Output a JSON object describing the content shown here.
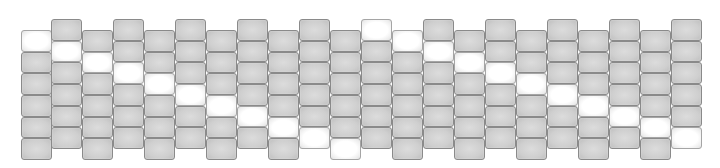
{
  "grid": {
    "columns": 22,
    "rows_per_column": 6,
    "column_x": [
      21,
      51,
      82,
      113,
      144,
      175,
      206,
      237,
      268,
      299,
      330,
      361,
      392,
      423,
      454,
      485,
      516,
      547,
      578,
      609,
      640,
      671
    ],
    "column_top": [
      30,
      19,
      30,
      19,
      30,
      19,
      30,
      19,
      30,
      19,
      30,
      19,
      30,
      19,
      30,
      19,
      30,
      19,
      30,
      19,
      30,
      19
    ],
    "highlighted_row_per_column": [
      0,
      1,
      1,
      2,
      2,
      3,
      3,
      4,
      4,
      5,
      5,
      0,
      0,
      1,
      1,
      2,
      2,
      3,
      3,
      4,
      4,
      5
    ],
    "colors": {
      "cell": "#cfcfcf",
      "cell_border": "#8a8a8a",
      "highlight": "#ffffff",
      "background": "#ffffff"
    }
  }
}
